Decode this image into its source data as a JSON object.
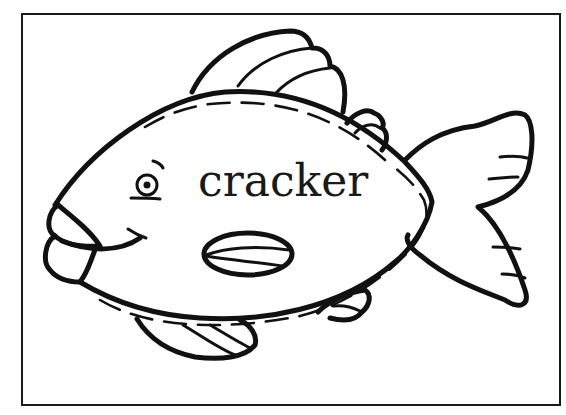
{
  "card": {
    "word": "cracker",
    "border_color": "#1a1a1a",
    "line_color": "#111111",
    "background": "#ffffff"
  },
  "illustration": {
    "subject": "fish-outline",
    "parts": [
      "body",
      "dorsal-fin",
      "rear-dorsal-fin",
      "tail-fin",
      "pectoral-fin",
      "pelvic-fin",
      "anal-fin",
      "lips",
      "eye",
      "stitch-outline"
    ]
  }
}
